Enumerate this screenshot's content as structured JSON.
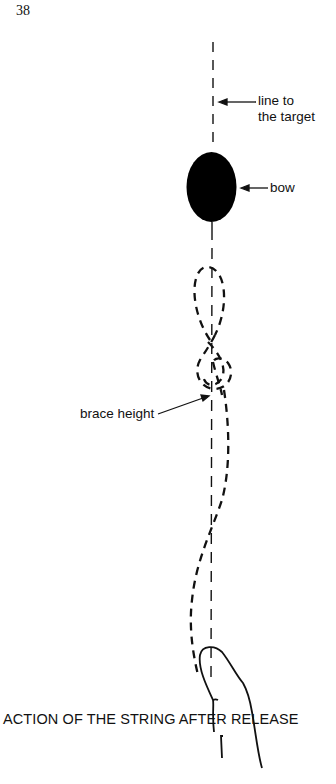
{
  "page": {
    "number": "38"
  },
  "figure": {
    "caption": "ACTION OF THE STRING AFTER RELEASE",
    "labels": {
      "line_to_target": [
        "line to",
        "the target"
      ],
      "bow": "bow",
      "brace_height": "brace height"
    },
    "elements": [
      "line to the target (dashed vertical)",
      "bow (filled ellipse)",
      "string path (dashed curve)",
      "archer's finger (outline)"
    ],
    "colors": {
      "ink": "#111111",
      "background": "#ffffff"
    }
  }
}
